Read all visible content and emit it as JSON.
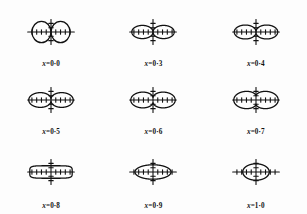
{
  "figure": {
    "name": "polar-contour-series",
    "background_color": "#fdfdfd",
    "stroke_color": "#111111",
    "rows": 3,
    "columns": 3
  },
  "chart_data": {
    "type": "line",
    "title": "",
    "xlabel": "",
    "ylabel": "",
    "grid": false,
    "legend": "none",
    "panels": [
      {
        "index": 0,
        "label": "x = 0·0",
        "label_var": "x",
        "label_equals": "=",
        "label_value": "0·0",
        "x": 0.0,
        "shape": "two tangent circles",
        "axis": {
          "x_half_length": 44,
          "y_half_length": 26,
          "x_ticks": 8,
          "y_ticks": 4,
          "tick_spacing": 9
        },
        "curve_r_max": 36,
        "curve_r_min": 0,
        "waist": 0.0
      },
      {
        "index": 1,
        "label": "x = 0·3",
        "label_var": "x",
        "label_equals": "=",
        "label_value": "0·3",
        "x": 0.3,
        "shape": "figure-of-eight, narrow waist",
        "axis": {
          "x_half_length": 44,
          "y_half_length": 26,
          "x_ticks": 8,
          "y_ticks": 4,
          "tick_spacing": 9
        },
        "curve_r_max": 40,
        "curve_r_min": 0,
        "waist": 0.02
      },
      {
        "index": 2,
        "label": "x = 0·4",
        "label_var": "x",
        "label_equals": "=",
        "label_value": "0·4",
        "x": 0.4,
        "shape": "figure-of-eight, opening waist",
        "axis": {
          "x_half_length": 44,
          "y_half_length": 26,
          "x_ticks": 8,
          "y_ticks": 4,
          "tick_spacing": 9
        },
        "curve_r_max": 41,
        "curve_r_min": 2,
        "waist": 0.07
      },
      {
        "index": 3,
        "label": "x = 0·5",
        "label_var": "x",
        "label_equals": "=",
        "label_value": "0·5",
        "x": 0.5,
        "shape": "figure-of-eight, wider waist",
        "axis": {
          "x_half_length": 44,
          "y_half_length": 26,
          "x_ticks": 8,
          "y_ticks": 4,
          "tick_spacing": 9
        },
        "curve_r_max": 42,
        "curve_r_min": 4,
        "waist": 0.13
      },
      {
        "index": 4,
        "label": "x = 0·6",
        "label_var": "x",
        "label_equals": "=",
        "label_value": "0·6",
        "x": 0.6,
        "shape": "dumbbell with pinched centre",
        "axis": {
          "x_half_length": 44,
          "y_half_length": 26,
          "x_ticks": 8,
          "y_ticks": 4,
          "tick_spacing": 9
        },
        "curve_r_max": 42,
        "curve_r_min": 8,
        "waist": 0.26
      },
      {
        "index": 5,
        "label": "x = 0·7",
        "label_var": "x",
        "label_equals": "=",
        "label_value": "0·7",
        "x": 0.7,
        "shape": "peanut, shallow waist",
        "axis": {
          "x_half_length": 44,
          "y_half_length": 26,
          "x_ticks": 8,
          "y_ticks": 4,
          "tick_spacing": 9
        },
        "curve_r_max": 42,
        "curve_r_min": 13,
        "waist": 0.45
      },
      {
        "index": 6,
        "label": "x = 0·8",
        "label_var": "x",
        "label_equals": "=",
        "label_value": "0·8",
        "x": 0.8,
        "shape": "stadium / rounded rectangle",
        "axis": {
          "x_half_length": 44,
          "y_half_length": 26,
          "x_ticks": 8,
          "y_ticks": 4,
          "tick_spacing": 9
        },
        "curve_r_max": 40,
        "curve_r_min": 19,
        "waist": 0.78
      },
      {
        "index": 7,
        "label": "x = 0·9",
        "label_var": "x",
        "label_equals": "=",
        "label_value": "0·9",
        "x": 0.9,
        "shape": "ellipse",
        "axis": {
          "x_half_length": 44,
          "y_half_length": 26,
          "x_ticks": 8,
          "y_ticks": 4,
          "tick_spacing": 9
        },
        "curve_r_max": 34,
        "curve_r_min": 22,
        "waist": 0.95
      },
      {
        "index": 8,
        "label": "x = 1·0",
        "label_var": "x",
        "label_equals": "=",
        "label_value": "1·0",
        "x": 1.0,
        "shape": "circle",
        "axis": {
          "x_half_length": 44,
          "y_half_length": 26,
          "x_ticks": 8,
          "y_ticks": 4,
          "tick_spacing": 9
        },
        "curve_r_max": 25,
        "curve_r_min": 25,
        "waist": 1.0
      }
    ]
  }
}
